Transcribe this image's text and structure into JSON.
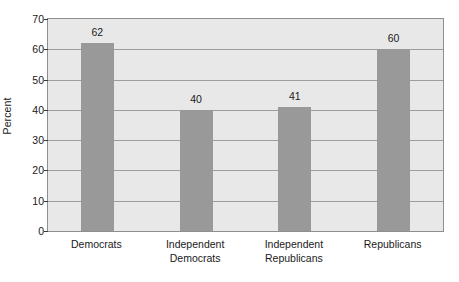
{
  "chart_data": {
    "type": "bar",
    "title": "",
    "subtitle": "",
    "xlabel": "",
    "ylabel": "Percent",
    "categories": [
      "Democrats",
      "Independent Democrats",
      "Independent Republicans",
      "Republicans"
    ],
    "category_lines": [
      [
        "Democrats",
        ""
      ],
      [
        "Independent",
        "Democrats"
      ],
      [
        "Independent",
        "Republicans"
      ],
      [
        "Republicans",
        ""
      ]
    ],
    "values": [
      62,
      40,
      41,
      60
    ],
    "value_labels": [
      "62",
      "40",
      "41",
      "60"
    ],
    "ylim": [
      0,
      70
    ],
    "yticks": [
      0,
      10,
      20,
      30,
      40,
      50,
      60,
      70
    ],
    "ytick_labels": [
      "0",
      "10",
      "20",
      "30",
      "40",
      "50",
      "60",
      "70"
    ],
    "grid": true,
    "grid_axis": "y",
    "legend": false,
    "legend_position": "none",
    "colors": {
      "bar": "#999999",
      "plot_background": "#e8e8e8",
      "figure_background": "#ffffff",
      "gridline": "#9d9d9d",
      "axis_border": "#8f8f8f",
      "text": "#1a1a1a"
    }
  }
}
